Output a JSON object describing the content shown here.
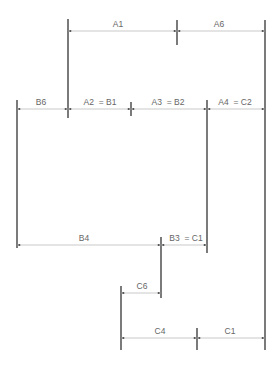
{
  "diagram": {
    "type": "dimension-chain",
    "colors": {
      "line": "#333333",
      "dimension": "#bbbbbb",
      "text": "#666666"
    },
    "dimensions": {
      "a1": "A1",
      "a6": "A6",
      "b6": "B6",
      "a2_b1": "A2  = B1",
      "a3_b2": "A3  = B2",
      "a4_c2": "A4  = C2",
      "b4": "B4",
      "b3_c1": "B3  = C1",
      "c6": "C6",
      "c4": "C4",
      "c1": "C1"
    }
  }
}
